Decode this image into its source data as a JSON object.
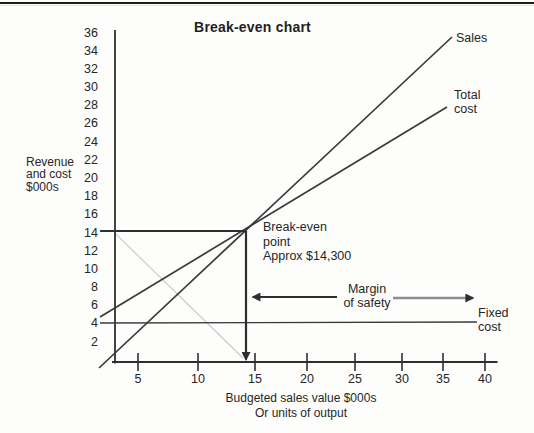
{
  "colors": {
    "axis": "#2f2f2f",
    "series_line": "#3a3a3a",
    "bold_line": "#2e2e2e",
    "faint_line": "#c9c9c9",
    "gray_arrow": "#8d8d8d",
    "arrow_head": "#2f2f2f",
    "text": "#262626"
  },
  "chart_data": {
    "type": "line",
    "title": "Break-even chart",
    "ylabel": "Revenue\nand cost\n$000s",
    "xlabel": "Budgeted sales value $000s\nOr units of output",
    "xlim": [
      0,
      40
    ],
    "ylim": [
      0,
      36
    ],
    "grid": false,
    "x_ticks": [
      5,
      10,
      15,
      20,
      25,
      30,
      35,
      40
    ],
    "y_ticks": [
      36,
      34,
      32,
      30,
      28,
      26,
      24,
      22,
      20,
      18,
      16,
      14,
      12,
      10,
      8,
      6,
      4,
      2
    ],
    "series": [
      {
        "name": "Sales",
        "label": "Sales",
        "points": [
          [
            -1.73,
            -0.66
          ],
          [
            36.43,
            35.56
          ]
        ]
      },
      {
        "name": "Total cost",
        "label": "Total\ncost",
        "points": [
          [
            -1.62,
            4.92
          ],
          [
            35.89,
            27.9
          ]
        ]
      },
      {
        "name": "Fixed cost",
        "label": "Fixed\ncost",
        "points": [
          [
            -1.62,
            4.27
          ],
          [
            39.14,
            4.38
          ]
        ]
      }
    ],
    "break_even": {
      "x_value": 14.3,
      "y_value": 14.3,
      "label": "Break-even\npoint\nApprox $14,300"
    },
    "margin_of_safety": {
      "label": "Margin\nof safety",
      "from_x": 14.3,
      "to_x": 40
    },
    "annotations": [
      {
        "name": "break-even-level-line",
        "from": [
          -1.62,
          14.33
        ],
        "to": [
          14.16,
          14.33
        ],
        "style": "bold"
      },
      {
        "name": "break-even-drop-arrow",
        "from": [
          14.16,
          14.33
        ],
        "to": [
          14.16,
          0.25
        ],
        "style": "bold",
        "arrow": true
      },
      {
        "name": "loss-diagonal-faint-line",
        "from": [
          0.11,
          13.98
        ],
        "to": [
          13.84,
          0.44
        ],
        "style": "faint"
      },
      {
        "name": "margin-of-safety-left-arrow",
        "from": [
          24.0,
          7.11
        ],
        "to": [
          14.9,
          7.11
        ],
        "style": "bold",
        "arrow": true
      },
      {
        "name": "margin-of-safety-right-arrow",
        "from": [
          30.05,
          7.0
        ],
        "to": [
          38.7,
          7.0
        ],
        "style": "grayarrow",
        "arrow": true
      }
    ]
  }
}
